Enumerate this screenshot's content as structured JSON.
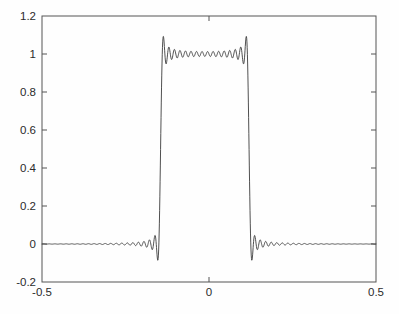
{
  "chart_data": {
    "type": "line",
    "title": "",
    "xlabel": "",
    "ylabel": "",
    "xlim": [
      -0.5,
      0.5
    ],
    "ylim": [
      -0.2,
      1.2
    ],
    "grid": false,
    "legend": null,
    "line_color": "#3c3c3c",
    "axis_color": "#555555",
    "background_color": "#fefefe",
    "xticks": [
      -0.5,
      0,
      0.5
    ],
    "xtick_labels": [
      "-0.5",
      "0",
      "0.5"
    ],
    "yticks": [
      -0.2,
      0,
      0.2,
      0.4,
      0.6,
      0.8,
      1,
      1.2
    ],
    "ytick_labels": [
      "-0.2",
      "0",
      "0.2",
      "0.4",
      "0.6",
      "0.8",
      "1",
      "1.2"
    ],
    "series": [
      {
        "name": "rect-pulse-fourier",
        "pulse_left_edge": -0.145,
        "pulse_right_edge": 0.12,
        "pulse_amplitude": 1.0,
        "baseline_level": 0.0,
        "ripple_amplitude_top": 0.02,
        "ripple_amplitude_baseline": 0.006,
        "num_harmonics": 60,
        "x": [
          -0.5,
          -0.45,
          -0.4,
          -0.35,
          -0.3,
          -0.25,
          -0.2,
          -0.16,
          -0.15,
          -0.145,
          -0.14,
          -0.13,
          -0.12,
          -0.1,
          -0.05,
          0,
          0.05,
          0.08,
          0.1,
          0.11,
          0.115,
          0.12,
          0.125,
          0.13,
          0.15,
          0.2,
          0.25,
          0.3,
          0.35,
          0.4,
          0.45,
          0.5
        ],
        "y": [
          0.0,
          0.004,
          0.0,
          0.005,
          0.0,
          0.004,
          0.0,
          0.003,
          0.0,
          0.0,
          0.3,
          0.9,
          1.015,
          1.005,
          1.0,
          1.0,
          1.0,
          1.005,
          1.01,
          1.015,
          1.01,
          0.85,
          0.4,
          0.02,
          0.0,
          0.004,
          0.0,
          0.005,
          0.0,
          0.004,
          0.0,
          0.005
        ]
      }
    ]
  },
  "axes": {
    "plot_left_px": 42,
    "plot_right_px": 376,
    "plot_top_px": 16,
    "plot_bottom_px": 282
  }
}
